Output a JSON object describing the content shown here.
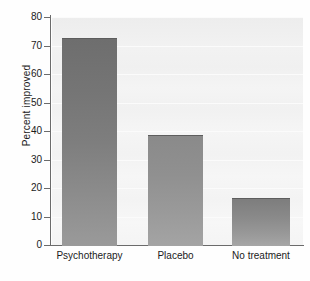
{
  "chart_data": {
    "type": "bar",
    "title": "",
    "xlabel": "",
    "ylabel": "Percent improved",
    "categories": [
      "Psychotherapy",
      "Placebo",
      "No treatment"
    ],
    "values": [
      72.8,
      38.5,
      16.4
    ],
    "ylim": [
      0,
      80
    ],
    "yticks": [
      0,
      10,
      20,
      30,
      40,
      50,
      60,
      70,
      80
    ],
    "ytick_labels": [
      "0",
      "10",
      "20",
      "30",
      "40",
      "50",
      "60",
      "70",
      "80"
    ],
    "grid": true,
    "legend": null,
    "bar_colors": [
      "#757575",
      "#909090",
      "#8a8a8a"
    ],
    "background_color": "#f2f2f2",
    "axis_color": "#6b6b6b"
  },
  "axes": {
    "y_title": "Percent improved"
  }
}
